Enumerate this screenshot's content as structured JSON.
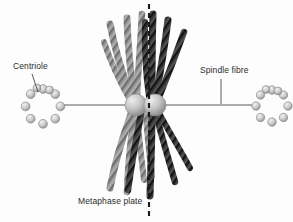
{
  "diagram": {
    "type": "biological-schematic",
    "background_color": "#fdfdfd",
    "width": 293,
    "height": 222
  },
  "labels": {
    "centriole": "Centriole",
    "spindle_fibre": "Spindle fibre",
    "metaphase_plate": "Metaphase plate"
  },
  "colors": {
    "chromatid_light": "#9a9a9a",
    "chromatid_light_shade": "#7d7d7d",
    "chromatid_dark": "#3c3c3c",
    "chromatid_dark_shade": "#232323",
    "centromere": "#c9c9c9",
    "centromere_shade": "#8e8e8e",
    "centriole_ring": "#bdbdbd",
    "centriole_outline": "#8a8a8a",
    "spindle_line": "#5a5a5a",
    "dashed_line": "#1a1a1a",
    "label_text": "#2b2b2b"
  },
  "structures": {
    "centriole_left": {
      "cx": 43,
      "cy": 105,
      "ring_radius": 16,
      "bead_count": 9,
      "bead_radius": 4.4
    },
    "centriole_right": {
      "cx": 272,
      "cy": 105,
      "ring_radius": 15,
      "bead_count": 9,
      "bead_radius": 4.2
    },
    "centromere_left": {
      "cx": 136,
      "cy": 105,
      "r": 11
    },
    "centromere_right": {
      "cx": 155,
      "cy": 105,
      "r": 11
    },
    "spindle_axis": {
      "y": 105,
      "x_start": 59,
      "x_end": 256
    },
    "metaphase_plate_line": {
      "x": 149,
      "y_start": 4,
      "y_end": 218,
      "dash": "5,4"
    },
    "leader_centriole": {
      "x1": 32,
      "y1": 74,
      "x2": 38,
      "y2": 92
    },
    "leader_spindle": {
      "x1": 221,
      "y1": 79,
      "x2": 221,
      "y2": 104
    }
  },
  "chromatids": {
    "note": "Four chromosomes, each with two sister chromatids (light and dark), arranged on the metaphase plate",
    "upper_light": 4,
    "upper_dark": 4,
    "lower_light": 4,
    "lower_dark": 4
  }
}
